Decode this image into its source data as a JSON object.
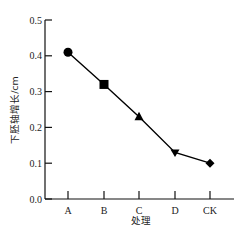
{
  "chart_data": {
    "type": "line",
    "title": "",
    "xlabel": "处理",
    "ylabel": "下胚轴增长/cm",
    "categories": [
      "A",
      "B",
      "C",
      "D",
      "CK"
    ],
    "series": [
      {
        "name": "下胚轴增长",
        "values": [
          0.41,
          0.32,
          0.23,
          0.13,
          0.1
        ],
        "markers": [
          "circle",
          "square",
          "triangle-up",
          "triangle-down",
          "diamond"
        ],
        "color": "#000000"
      }
    ],
    "ylim": [
      0.0,
      0.5
    ],
    "yticks": [
      "0.0",
      "0.1",
      "0.2",
      "0.3",
      "0.4",
      "0.5"
    ],
    "grid": false,
    "legend": null
  }
}
